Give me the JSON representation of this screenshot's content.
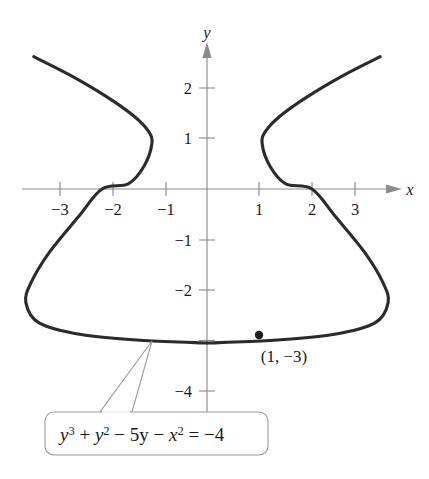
{
  "figure": {
    "background_color": "#ffffff",
    "curve_color": "#2b2b2b",
    "axis_color": "#8c8c8c",
    "text_color": "#1a1a1a",
    "callout_border_color": "#9a9a9a"
  },
  "axes": {
    "x_label": "x",
    "y_label": "y",
    "x_ticks": [
      "−3",
      "−2",
      "−1",
      "1",
      "2",
      "3"
    ],
    "y_ticks": [
      "2",
      "1",
      "−1",
      "−2",
      "−4"
    ],
    "x_axis_arrow": "arrow-right",
    "y_axis_arrow": "arrow-up"
  },
  "annotations": {
    "point_label": "(1, −3)",
    "equation_parts": {
      "y_var": "y",
      "exp3": "3",
      "plus": " + ",
      "y_var2": "y",
      "exp2": "2",
      "minus_five_y": " − 5y − ",
      "x_var": "x",
      "exp2b": "2",
      "equals": " = −4"
    },
    "equation_plain": "y3 + y2 − 5y − x2 = −4"
  },
  "chart_data": {
    "type": "line",
    "title": "",
    "xlabel": "x",
    "ylabel": "y",
    "xlim": [
      -3.6,
      3.8
    ],
    "ylim": [
      -4.6,
      2.8
    ],
    "grid": false,
    "legend": false,
    "equation": "y^3 + y^2 - 5y - x^2 = -4",
    "annotated_points": [
      {
        "label": "(1, −3)",
        "x": 1,
        "y": -3
      }
    ],
    "x_ticks": [
      -3,
      -2,
      -1,
      1,
      2,
      3
    ],
    "y_ticks": [
      2,
      1,
      -1,
      -2,
      -4
    ],
    "features": {
      "x_intercepts": [
        -2,
        2
      ],
      "vertical_tangents": [
        {
          "x": -1.05,
          "y": 1.1
        },
        {
          "x": 1.05,
          "y": 1.1
        }
      ],
      "leftmost_extent": {
        "x": -3.45,
        "y": -2.2
      },
      "rightmost_extent": {
        "x": 3.45,
        "y": -2.2
      },
      "bottom_y": -3.05,
      "upper_branch_endpoints": [
        {
          "x": -3.3,
          "y": 2.6
        },
        {
          "x": 3.3,
          "y": 2.6
        }
      ]
    },
    "series": [
      {
        "name": "implicit-curve-upper-left",
        "points": [
          {
            "x": -3.3,
            "y": 2.62
          },
          {
            "x": -2.6,
            "y": 2.25
          },
          {
            "x": -1.9,
            "y": 1.82
          },
          {
            "x": -1.4,
            "y": 1.45
          },
          {
            "x": -1.12,
            "y": 1.15
          },
          {
            "x": -1.05,
            "y": 0.9
          },
          {
            "x": -1.2,
            "y": 0.45
          },
          {
            "x": -1.5,
            "y": 0.1
          },
          {
            "x": -2.0,
            "y": 0.0
          },
          {
            "x": -2.45,
            "y": -0.55
          },
          {
            "x": -3.0,
            "y": -1.25
          },
          {
            "x": -3.35,
            "y": -1.85
          },
          {
            "x": -3.45,
            "y": -2.25
          },
          {
            "x": -3.2,
            "y": -2.65
          },
          {
            "x": -2.4,
            "y": -2.88
          },
          {
            "x": -1.2,
            "y": -3.0
          },
          {
            "x": 0,
            "y": -3.05
          }
        ]
      },
      {
        "name": "implicit-curve-upper-right",
        "points": [
          {
            "x": 3.3,
            "y": 2.62
          },
          {
            "x": 2.6,
            "y": 2.25
          },
          {
            "x": 1.9,
            "y": 1.82
          },
          {
            "x": 1.4,
            "y": 1.45
          },
          {
            "x": 1.12,
            "y": 1.15
          },
          {
            "x": 1.05,
            "y": 0.9
          },
          {
            "x": 1.2,
            "y": 0.45
          },
          {
            "x": 1.5,
            "y": 0.1
          },
          {
            "x": 2.0,
            "y": 0.0
          },
          {
            "x": 2.45,
            "y": -0.55
          },
          {
            "x": 3.0,
            "y": -1.25
          },
          {
            "x": 3.35,
            "y": -1.85
          },
          {
            "x": 3.45,
            "y": -2.25
          },
          {
            "x": 3.2,
            "y": -2.65
          },
          {
            "x": 2.4,
            "y": -2.88
          },
          {
            "x": 1.2,
            "y": -3.0
          },
          {
            "x": 0,
            "y": -3.05
          }
        ]
      }
    ]
  },
  "geometry": {
    "origin_px": {
      "x": 207,
      "y": 189
    },
    "unit_px": {
      "x": 52.5,
      "y": 50.5
    },
    "x_axis": {
      "x1": 22,
      "x2": 396,
      "y": 189
    },
    "y_axis": {
      "x": 207,
      "y1": 48,
      "y2": 445
    },
    "x_tick_px": [
      60,
      113,
      166,
      259,
      312,
      355
    ],
    "y_tick_px": [
      88,
      138,
      240,
      290,
      391
    ],
    "callout_box": {
      "x": 45,
      "y": 412,
      "w": 223,
      "h": 43,
      "r": 9
    },
    "callout_tail": [
      {
        "x": 152,
        "y": 341
      },
      {
        "x": 132,
        "y": 412
      },
      {
        "x": 100,
        "y": 412
      }
    ],
    "point_dot_px": {
      "x": 259,
      "y": 335,
      "r": 4.2
    },
    "point_label_px": {
      "x": 248,
      "y": 362
    },
    "equation_text_px": {
      "x": 60,
      "y": 441
    }
  }
}
